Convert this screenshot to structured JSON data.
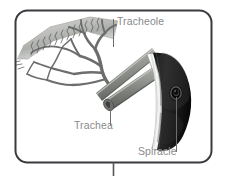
{
  "figure": {
    "border_color": "#3b3b3f",
    "background_color": "#ffffff",
    "label_color": "#8a8a8a",
    "leader_line_color": "#6e6e6e",
    "connector_color": "#555558"
  },
  "labels": [
    {
      "id": "tracheole",
      "text": "Tracheole",
      "leader": {
        "x1": 113,
        "y1": 19,
        "x2": 113,
        "y2": 47
      }
    },
    {
      "id": "trachea",
      "text": "Trachea",
      "leader": {
        "x1": 110,
        "y1": 100,
        "x2": 110,
        "y2": 126
      }
    },
    {
      "id": "spiracle",
      "text": "Spiracle",
      "leader": {
        "x1": 176,
        "y1": 97,
        "x2": 176,
        "y2": 152
      }
    }
  ],
  "parts": {
    "tracheole": {
      "name": "Tracheole",
      "color_band": "#bfc0be",
      "color_branch": "#6f7270",
      "color_branch_dark": "#565958"
    },
    "trachea": {
      "name": "Trachea",
      "color_tube": "#8a8c88",
      "color_tube_light": "#b9bbb6",
      "color_tube_dark": "#5c5f5b"
    },
    "spiracle": {
      "name": "Spiracle",
      "color_plate": "#1a1a1a",
      "color_plate_edge": "#f2f2f0",
      "color_plate_rim": "#9a9c98",
      "color_opening": "#000000"
    }
  },
  "frame": {
    "box": {
      "x": 15,
      "y": 10,
      "width": 197,
      "height": 153,
      "radius": 12
    },
    "stem": {
      "x": 113,
      "y1": 163,
      "y2": 176
    }
  }
}
